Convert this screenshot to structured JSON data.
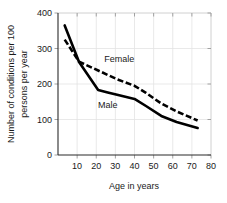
{
  "chart_data": {
    "type": "line",
    "title": "",
    "xlabel": "Age in years",
    "ylabel": "Number of conditions per 100 persons per year",
    "ylabel_line1": "Number of conditions per 100",
    "ylabel_line2": "persons per year",
    "xlim": [
      0,
      80
    ],
    "ylim": [
      0,
      400
    ],
    "xticks": [
      10,
      20,
      30,
      40,
      50,
      60,
      70,
      80
    ],
    "yticks": [
      0,
      100,
      200,
      300,
      400
    ],
    "xtick_labels": [
      "10",
      "20",
      "30",
      "40",
      "50",
      "60",
      "70",
      "80"
    ],
    "ytick_labels": [
      "0",
      "100",
      "200",
      "300",
      "400"
    ],
    "grid": true,
    "legend": "inline-annotations",
    "series": [
      {
        "name": "Male",
        "style": "solid",
        "color": "#000000",
        "x": [
          3.5,
          11,
          21,
          26,
          32,
          40,
          46,
          54,
          62,
          73
        ],
        "values": [
          365,
          262,
          183,
          176,
          168,
          158,
          138,
          110,
          93,
          76
        ]
      },
      {
        "name": "Female",
        "style": "dashed",
        "color": "#000000",
        "x": [
          3.5,
          11,
          21,
          31,
          40,
          46,
          54,
          62,
          73
        ],
        "values": [
          325,
          263,
          238,
          213,
          195,
          175,
          145,
          123,
          97
        ]
      }
    ],
    "annotations": [
      {
        "text": "Female",
        "x": 32,
        "y": 262
      },
      {
        "text": "Male",
        "x": 26,
        "y": 133
      }
    ]
  },
  "colors": {
    "background": "#ffffff",
    "ink": "#1a1a1a",
    "grid": "#e3e3e3",
    "frame": "#d8d8d8",
    "axis": "#2b2b2b",
    "series": "#000000"
  }
}
